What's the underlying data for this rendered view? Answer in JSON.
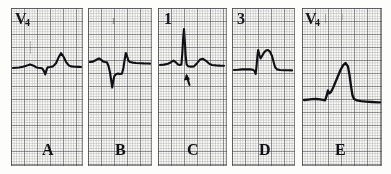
{
  "figure": {
    "width": 391,
    "height": 174,
    "background_color": "#ffffff",
    "paper_color": "#fbfbf8",
    "grid_fine_color": "#78787f",
    "grid_bold_color": "#46464e",
    "trace_color": "#101014"
  },
  "panels": [
    {
      "id": "panel-a",
      "letter": "A",
      "lead": "V",
      "lead_subscript": "4",
      "lead_display": "V4",
      "x": 11,
      "y": 8,
      "width": 72,
      "height": 158,
      "annotation_arrow": false,
      "faint_mark": "",
      "trace_path": "M 2 60 L 8 59.5 L 12 58.8 L 16 57.6 L 19 56.4 L 22 57.4 L 25 59.2 L 27 59.8 L 29 60.0 L 31 60.2 L 33 63.2 L 34.2 66.4 L 35.4 62.4 L 36.6 59.4 L 39 59.0 L 42 58.4 L 45 55.2 L 47.5 49.6 L 50 45.2 L 52.5 48.6 L 55 53.8 L 57.5 57.2 L 60 58.4 L 64 58.8 L 68 58.9 L 70 59.0",
      "baseline_y": 59
    },
    {
      "id": "panel-b",
      "letter": "B",
      "lead": "",
      "lead_subscript": "",
      "lead_display": "",
      "x": 88,
      "y": 8,
      "width": 64,
      "height": 158,
      "annotation_arrow": false,
      "faint_mark": "I",
      "trace_path": "M 2 54 L 5 53.6 L 8 52.0 L 11 50.4 L 13 51.6 L 15 53.4 L 17 54.0 L 19 54.4 L 20.5 58.0 L 22 64.5 L 23.2 72.5 L 24.2 79.5 L 25.2 73.0 L 26.4 68.0 L 28 66.2 L 30 65.6 L 32 66.0 L 34 65.6 L 35.4 60.0 L 36.6 52.0 L 37.8 45.0 L 39 48.0 L 40.4 52.6 L 42 54.0 L 45 54.6 L 48 55.0 L 52 55.2 L 56 55.4 L 60 55.5 L 62 55.6",
      "baseline_y": 54
    },
    {
      "id": "panel-c",
      "letter": "C",
      "lead": "1",
      "lead_subscript": "",
      "lead_display": "1",
      "x": 158,
      "y": 8,
      "width": 69,
      "height": 158,
      "annotation_arrow": true,
      "arrow_label": "ST segment",
      "arrow_x": 29,
      "arrow_y": 68,
      "faint_mark": "",
      "trace_path": "M 2 57 L 6 56.6 L 10 55.8 L 13 54.2 L 15.5 52.6 L 18 54.4 L 20 56.4 L 22 57.0 L 23.4 56.6 L 24.4 44.0 L 25.2 30.0 L 26.0 21.0 L 26.8 33.0 L 27.6 47.0 L 28.6 56.4 L 30 58.2 L 33 58.6 L 36 58.4 L 39 55.2 L 42 51.6 L 45 50.8 L 48 52.8 L 51 55.6 L 54 57.0 L 58 57.4 L 62 57.6 L 66 57.7",
      "baseline_y": 57
    },
    {
      "id": "panel-d",
      "letter": "D",
      "lead": "3",
      "lead_subscript": "",
      "lead_display": "3",
      "x": 232,
      "y": 8,
      "width": 63,
      "height": 158,
      "annotation_arrow": false,
      "faint_mark": "",
      "trace_path": "M 2 62 L 6 61.8 L 10 61.4 L 14 61.2 L 18 61.4 L 21 61.8 L 22.6 63.0 L 23.6 66.0 L 24.6 58.0 L 25.4 48.0 L 26.2 42.0 L 27.4 47.0 L 28.6 50.4 L 30 48.0 L 32 44.6 L 34 42.6 L 36 42.0 L 38 43.8 L 40 48.0 L 41.6 54.0 L 43 59.0 L 45 61.4 L 48 62.0 L 52 62.2 L 56 62.3 L 60 62.4",
      "baseline_y": 62
    },
    {
      "id": "panel-e",
      "letter": "E",
      "lead": "V",
      "lead_subscript": "4",
      "lead_display": "V4",
      "x": 302,
      "y": 8,
      "width": 80,
      "height": 158,
      "annotation_arrow": false,
      "faint_mark": "",
      "trace_path": "M 2 92 L 6 91.6 L 10 91.2 L 14 91.0 L 18 91.4 L 21 91.8 L 23 92.4 L 24.6 88.0 L 26 82.4 L 27.4 85.4 L 29 84.0 L 31 80.0 L 33.5 74.0 L 36 68.0 L 38.5 62.0 L 41 57.4 L 43.5 55.0 L 46 58.6 L 47.5 67.0 L 49 78.0 L 50.4 87.0 L 52 91.0 L 55 92.4 L 59 93.2 L 64 93.6 L 70 94.0 L 76 94.3 L 78 94.4",
      "baseline_y": 92
    }
  ]
}
